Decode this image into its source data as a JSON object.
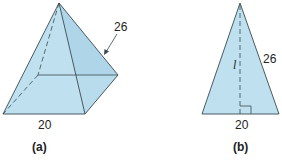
{
  "colors": {
    "fill": "#bfe0ee",
    "fill_side": "#aed6e8",
    "stroke": "#3a4a52",
    "text": "#222222"
  },
  "figure_a": {
    "caption": "(a)",
    "base_label": "20",
    "edge_label": "26",
    "shape": "square pyramid"
  },
  "figure_b": {
    "caption": "(b)",
    "base_label": "20",
    "side_label": "26",
    "height_label": "l",
    "shape": "isosceles triangle with altitude"
  }
}
